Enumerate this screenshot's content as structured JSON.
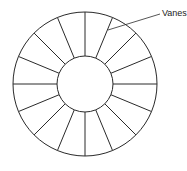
{
  "diagram": {
    "type": "annular ring with radial vanes",
    "label": "Vanes",
    "vane_count": 16,
    "geometry": {
      "center": [
        85,
        84
      ],
      "outer_radius": 72,
      "inner_radius": 28
    },
    "leader": {
      "from": [
        160,
        14
      ],
      "to": [
        108,
        30
      ]
    },
    "colors": {
      "stroke": "#2a2a2a",
      "background": "#ffffff",
      "text": "#222222"
    }
  }
}
